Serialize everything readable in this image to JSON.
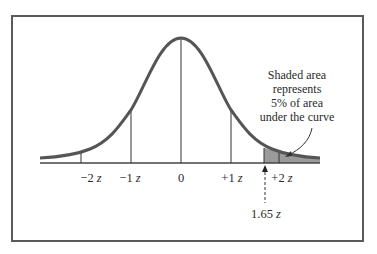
{
  "figure": {
    "type": "normal-distribution",
    "annotation": {
      "lines": [
        "Shaded area",
        "represents",
        "5% of area",
        "under the curve"
      ]
    },
    "axis_labels": [
      {
        "text": "−2",
        "unit": "z",
        "z": -2
      },
      {
        "text": "−1",
        "unit": "z",
        "z": -1
      },
      {
        "text": "0",
        "unit": "",
        "z": 0
      },
      {
        "text": "+1",
        "unit": "z",
        "z": 1
      },
      {
        "text": "+2",
        "unit": "z",
        "z": 2
      }
    ],
    "critical_value": {
      "text": "1.65",
      "unit": "z",
      "z": 1.65
    },
    "shaded_region": {
      "from_z": 1.65,
      "to_z": "tail",
      "percent": 5
    },
    "colors": {
      "curve": "#555555",
      "shade": "#9a9a9a",
      "line": "#333333",
      "frame": "#5a5a5a"
    }
  }
}
